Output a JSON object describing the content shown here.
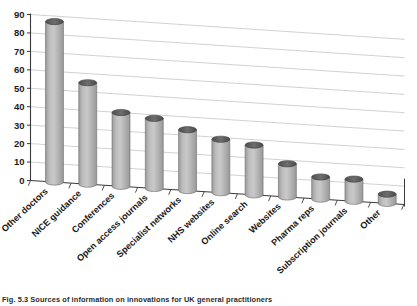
{
  "figure": {
    "caption_label": "Fig. 5.3",
    "caption_text": "Sources of information on innovations for UK general practitioners"
  },
  "chart_data": {
    "type": "bar",
    "title": "",
    "subtitle": "",
    "xlabel": "",
    "ylabel": "",
    "grid": true,
    "legend": "none",
    "three_d": true,
    "bar_style": "cylinder",
    "ylim": [
      0,
      90
    ],
    "ytick_step": 10,
    "yticks": [
      "90",
      "80",
      "70",
      "60",
      "50",
      "40",
      "30",
      "20",
      "10",
      "0"
    ],
    "categories": [
      "Other doctors",
      "NICE guidance",
      "Conferences",
      "Open access journals",
      "Specialist networks",
      "NHS websites",
      "Online search",
      "Websites",
      "Pharma reps",
      "Subscription journals",
      "Other"
    ],
    "values": [
      87,
      55,
      40,
      38,
      33,
      29,
      27,
      18,
      12,
      12,
      5
    ],
    "colors": {
      "bar_fill_light": "#c9c9c9",
      "bar_fill_mid": "#aeaeae",
      "bar_fill_dark": "#9a9a9a",
      "bar_top": "#5f5f5f",
      "axis": "#3a3a3a",
      "grid": "#bdbdbd",
      "background": "#ffffff"
    }
  }
}
